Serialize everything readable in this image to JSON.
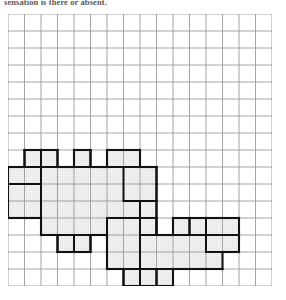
{
  "caption": {
    "text": "sensation is there or absent."
  },
  "figure": {
    "name": "body-chart-grid",
    "colors": {
      "grid_line": "#9a9a9a",
      "grid_line_faint": "#c9c9c9",
      "shade_fill": "#eeeeee",
      "outline": "#111111",
      "background": "#ffffff"
    },
    "grid": {
      "columns": 16,
      "rows": 16,
      "cell_size_px": 16.5,
      "origin_x_px": 8,
      "origin_y_px": 14,
      "width_px": 264,
      "height_px": 272
    },
    "shaded_cells": [
      {
        "row": 8,
        "cols": [
          1,
          2,
          4,
          6,
          7
        ]
      },
      {
        "row": 9,
        "cols": [
          0,
          1,
          2,
          3,
          4,
          5,
          6,
          7,
          8
        ]
      },
      {
        "row": 10,
        "cols": [
          0,
          1,
          2,
          3,
          4,
          5,
          6,
          7,
          8
        ]
      },
      {
        "row": 11,
        "cols": [
          0,
          1,
          2,
          3,
          4,
          5,
          6,
          7,
          8
        ]
      },
      {
        "row": 12,
        "cols": [
          2,
          3,
          4,
          5,
          6,
          7,
          8,
          10,
          11,
          12,
          13
        ]
      },
      {
        "row": 13,
        "cols": [
          3,
          4,
          6,
          7,
          8,
          9,
          10,
          11,
          12,
          13
        ]
      },
      {
        "row": 14,
        "cols": [
          6,
          7,
          8,
          9,
          10,
          11,
          12
        ]
      },
      {
        "row": 15,
        "cols": [
          7,
          8,
          9
        ]
      }
    ],
    "bold_sub_blocks": [
      {
        "row": 8,
        "col": 1,
        "w": 1,
        "h": 1
      },
      {
        "row": 8,
        "col": 2,
        "w": 1,
        "h": 1
      },
      {
        "row": 8,
        "col": 4,
        "w": 1,
        "h": 1
      },
      {
        "row": 8,
        "col": 6,
        "w": 2,
        "h": 1
      },
      {
        "row": 9,
        "col": 0,
        "w": 2,
        "h": 1
      },
      {
        "row": 9,
        "col": 7,
        "w": 2,
        "h": 2
      },
      {
        "row": 10,
        "col": 0,
        "w": 2,
        "h": 2
      },
      {
        "row": 11,
        "col": 8,
        "w": 1,
        "h": 2
      },
      {
        "row": 13,
        "col": 3,
        "w": 1,
        "h": 1
      },
      {
        "row": 13,
        "col": 4,
        "w": 1,
        "h": 1
      },
      {
        "row": 12,
        "col": 10,
        "w": 1,
        "h": 1
      },
      {
        "row": 12,
        "col": 11,
        "w": 1,
        "h": 1
      },
      {
        "row": 12,
        "col": 12,
        "w": 2,
        "h": 1
      },
      {
        "row": 13,
        "col": 12,
        "w": 2,
        "h": 1
      },
      {
        "row": 15,
        "col": 7,
        "w": 1,
        "h": 1
      },
      {
        "row": 15,
        "col": 8,
        "w": 1,
        "h": 1
      },
      {
        "row": 15,
        "col": 9,
        "w": 1,
        "h": 1
      },
      {
        "row": 12,
        "col": 6,
        "w": 2,
        "h": 3
      },
      {
        "row": 12,
        "col": 8,
        "w": 1,
        "h": 1
      }
    ]
  }
}
